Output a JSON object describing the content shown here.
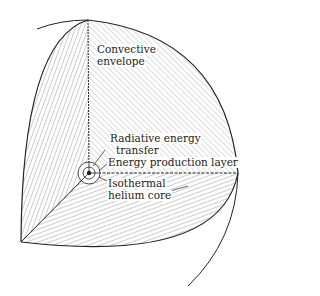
{
  "diagram": {
    "labels": {
      "convective_line1": "Convective",
      "convective_line2": "envelope",
      "radiative_line1": "Radiative energy",
      "radiative_line2": "transfer",
      "energy_production": "Energy production layer",
      "core_line1": "Isothermal",
      "core_line2": "helium core"
    },
    "colors": {
      "stroke": "#222222",
      "hatch": "#555555",
      "background": "#ffffff"
    }
  }
}
